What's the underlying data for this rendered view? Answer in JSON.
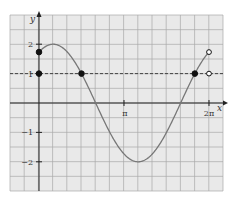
{
  "chart_data": {
    "type": "line",
    "title": "",
    "xlabel": "x",
    "ylabel": "y",
    "function": "y = 2 sin(x + π/3)",
    "xlim": [
      -1.0,
      6.6
    ],
    "ylim": [
      -3.0,
      3.0
    ],
    "domain": [
      0,
      6.283185
    ],
    "x_ticks": [
      {
        "value": 3.141593,
        "label": "π"
      },
      {
        "value": 6.283185,
        "label": "2π"
      }
    ],
    "y_ticks": [
      {
        "value": 2,
        "label": "2"
      },
      {
        "value": 1,
        "label": "1"
      },
      {
        "value": -1,
        "label": "−1"
      },
      {
        "value": -2,
        "label": "−2"
      }
    ],
    "grid": true,
    "reference_line": {
      "y": 1,
      "style": "dashed"
    },
    "series": [
      {
        "name": "curve",
        "x_start": 0,
        "x_end": 6.283185,
        "amplitude": 2,
        "phase": 1.047198
      }
    ],
    "points": [
      {
        "x": 0,
        "y": 1.732,
        "filled": true
      },
      {
        "x": 0,
        "y": 1,
        "filled": true
      },
      {
        "x": 1.570796,
        "y": 1,
        "filled": true
      },
      {
        "x": 5.759587,
        "y": 1,
        "filled": true
      },
      {
        "x": 6.283185,
        "y": 1.732,
        "filled": false
      },
      {
        "x": 6.283185,
        "y": 1,
        "filled": false
      }
    ],
    "colors": {
      "grid_bg": "#e9e9e9",
      "grid_line": "#a9a9a9",
      "axis": "#222222",
      "curve": "#777777",
      "point": "#111111"
    }
  }
}
